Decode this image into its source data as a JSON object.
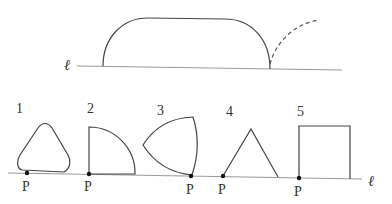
{
  "top_figure": {
    "line_label": "ℓ"
  },
  "bottom_figure": {
    "line_label": "ℓ",
    "shapes": [
      {
        "number": "1",
        "point_label": "P",
        "shape": "rounded-triangle"
      },
      {
        "number": "2",
        "point_label": "P",
        "shape": "quarter-circle"
      },
      {
        "number": "3",
        "point_label": "P",
        "shape": "reuleaux-triangle"
      },
      {
        "number": "4",
        "point_label": "P",
        "shape": "triangle"
      },
      {
        "number": "5",
        "point_label": "P",
        "shape": "square"
      }
    ]
  }
}
